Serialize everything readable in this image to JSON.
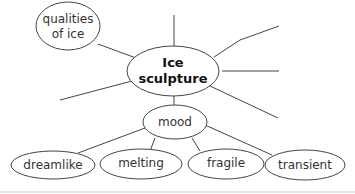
{
  "diagram": {
    "type": "mind-map",
    "colors": {
      "stroke": "#444444",
      "text": "#333333",
      "background": "#ffffff",
      "rule": "#cccccc"
    },
    "central": {
      "line1": "Ice",
      "line2": "sculpture"
    },
    "nodes": {
      "qualities": {
        "line1": "qualities",
        "line2": "of ice"
      },
      "mood": {
        "label": "mood"
      },
      "dreamlike": {
        "label": "dreamlike"
      },
      "melting": {
        "label": "melting"
      },
      "fragile": {
        "label": "fragile"
      },
      "transient": {
        "label": "transient"
      }
    },
    "empty_branches": 5
  }
}
